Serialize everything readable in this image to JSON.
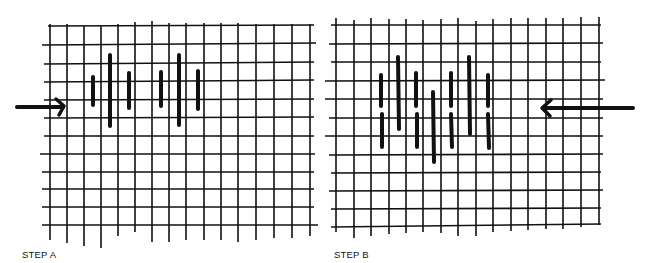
{
  "diagram": {
    "type": "needlework stitch diagram on canvas grid",
    "panels": [
      {
        "id": "step-a",
        "label": "STEP A",
        "arrow_direction": "right",
        "arrow_color": "#111111",
        "grid": {
          "columns": 16,
          "rows": 12
        },
        "stitches": [
          {
            "col": 1,
            "length": "short"
          },
          {
            "col": 2,
            "length": "long"
          },
          {
            "col": 3,
            "length": "short"
          },
          {
            "col": 5,
            "length": "short"
          },
          {
            "col": 6,
            "length": "long"
          },
          {
            "col": 7,
            "length": "short"
          }
        ]
      },
      {
        "id": "step-b",
        "label": "STEP B",
        "arrow_direction": "left",
        "arrow_color": "#111111",
        "grid": {
          "columns": 16,
          "rows": 12
        },
        "stitches": [
          {
            "col": 1,
            "length": "medium",
            "split": true
          },
          {
            "col": 2,
            "length": "long"
          },
          {
            "col": 3,
            "length": "medium",
            "split": true
          },
          {
            "col": 4,
            "length": "long-low"
          },
          {
            "col": 5,
            "length": "medium",
            "split": true
          },
          {
            "col": 6,
            "length": "long"
          },
          {
            "col": 7,
            "length": "medium",
            "split": true
          }
        ]
      }
    ],
    "colors": {
      "ink": "#111111",
      "background": "#ffffff"
    }
  }
}
